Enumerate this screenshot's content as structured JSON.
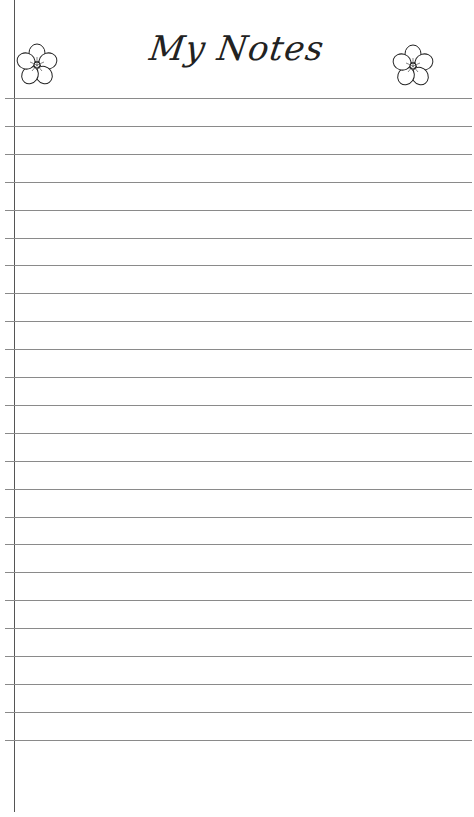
{
  "page": {
    "title": "My Notes",
    "decorations": {
      "left_icon": "flower-icon",
      "right_icon": "flower-icon"
    },
    "ruled_lines": {
      "count": 24,
      "first_y": 98,
      "spacing": 27.9,
      "color": "#8a8a8a"
    },
    "margin_line_color": "#555555"
  }
}
